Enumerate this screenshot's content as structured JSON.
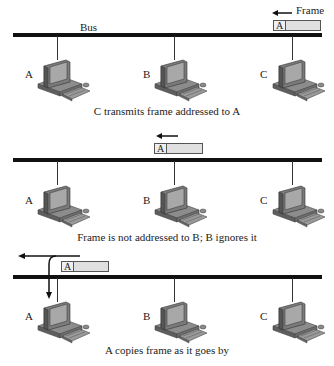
{
  "diagram": {
    "bus_label": "Bus",
    "frame_label": "Frame",
    "colors": {
      "bus": "#111111",
      "frame_fill": "#e0e0e0",
      "frame_border": "#555555",
      "computer": "#7a7a7a"
    },
    "panels": [
      {
        "nodes": [
          "A",
          "B",
          "C"
        ],
        "frame_address": "A",
        "caption": "C transmits frame addressed to A"
      },
      {
        "nodes": [
          "A",
          "B",
          "C"
        ],
        "frame_address": "A",
        "caption": "Frame is not addressed to B; B ignores it"
      },
      {
        "nodes": [
          "A",
          "B",
          "C"
        ],
        "frame_address": "A",
        "caption": "A copies frame as it goes by"
      }
    ]
  }
}
